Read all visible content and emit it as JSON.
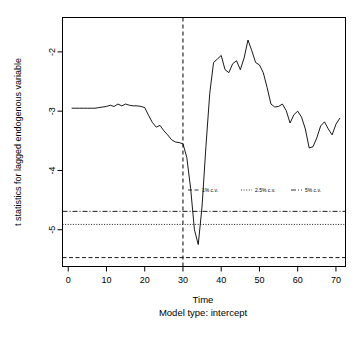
{
  "chart_data": {
    "type": "line",
    "title": "",
    "xlabel": "Time",
    "sublabel": "Model type: intercept",
    "ylabel": "t statistics for lagged endogenous variable",
    "xlim": [
      -1.5,
      72.5
    ],
    "ylim": [
      -5.62,
      -1.42
    ],
    "xticks": [
      0,
      10,
      20,
      30,
      40,
      50,
      60,
      70
    ],
    "yticks": [
      -2,
      -3,
      -4,
      -5
    ],
    "xtick_labels": [
      "0",
      "10",
      "20",
      "30",
      "40",
      "50",
      "60",
      "70"
    ],
    "ytick_labels": [
      "-2",
      "-3",
      "-4",
      "-5"
    ],
    "grid": false,
    "legend_position": "center-middle",
    "series": [
      {
        "name": "t statistics",
        "style": "solid",
        "color": "#000000",
        "x": [
          1,
          2,
          3,
          4,
          5,
          6,
          7,
          8,
          9,
          10,
          11,
          12,
          13,
          14,
          15,
          16,
          17,
          18,
          19,
          20,
          21,
          22,
          23,
          24,
          25,
          26,
          27,
          28,
          29,
          30,
          31,
          32,
          33,
          34,
          35,
          36,
          37,
          38,
          39,
          40,
          41,
          42,
          43,
          44,
          45,
          46,
          47,
          48,
          49,
          50,
          51,
          52,
          53,
          54,
          55,
          56,
          57,
          58,
          59,
          60,
          61,
          62,
          63,
          64,
          65,
          66,
          67,
          68,
          69,
          70,
          71
        ],
        "values": [
          -2.95,
          -2.95,
          -2.95,
          -2.95,
          -2.95,
          -2.95,
          -2.95,
          -2.94,
          -2.93,
          -2.92,
          -2.9,
          -2.92,
          -2.88,
          -2.91,
          -2.88,
          -2.9,
          -2.91,
          -2.91,
          -2.92,
          -2.94,
          -3.07,
          -3.19,
          -3.27,
          -3.24,
          -3.33,
          -3.4,
          -3.48,
          -3.52,
          -3.53,
          -3.55,
          -3.78,
          -4.3,
          -5.0,
          -5.25,
          -4.6,
          -3.6,
          -2.7,
          -2.18,
          -2.12,
          -2.06,
          -2.3,
          -2.35,
          -2.2,
          -2.15,
          -2.3,
          -2.1,
          -1.8,
          -1.98,
          -2.18,
          -2.22,
          -2.35,
          -2.6,
          -2.88,
          -2.93,
          -2.92,
          -2.88,
          -2.99,
          -3.2,
          -3.06,
          -3.0,
          -3.1,
          -3.3,
          -3.62,
          -3.6,
          -3.45,
          -3.25,
          -3.18,
          -3.3,
          -3.4,
          -3.22,
          -3.12
        ]
      },
      {
        "name": "1% c.v.",
        "style": "dashed",
        "color": "#000000",
        "value": -5.47
      },
      {
        "name": "2.5% c.v.",
        "style": "dotted",
        "color": "#000000",
        "value": -4.91
      },
      {
        "name": "5% c.v.",
        "style": "dashdot",
        "color": "#000000",
        "value": -4.69
      },
      {
        "name": "breakpoint",
        "style": "dashed-vertical",
        "color": "#000000",
        "value": 30
      }
    ]
  },
  "axes": {
    "ylabel": "t statistics for lagged endogenous variable",
    "xlabel": "Time",
    "sublabel": "Model type: intercept",
    "xtick_labels": [
      "0",
      "10",
      "20",
      "30",
      "40",
      "50",
      "60",
      "70"
    ],
    "ytick_labels": [
      "-2",
      "-3",
      "-4",
      "-5"
    ]
  },
  "legend": {
    "items": [
      {
        "label": "1% c.v.",
        "style": "dashed"
      },
      {
        "label": "2.5% c.v.",
        "style": "dotted"
      },
      {
        "label": "5% c.v.",
        "style": "dashdot"
      }
    ]
  },
  "colors": {
    "foreground": "#000000",
    "background": "#ffffff",
    "axis": "#000000"
  }
}
